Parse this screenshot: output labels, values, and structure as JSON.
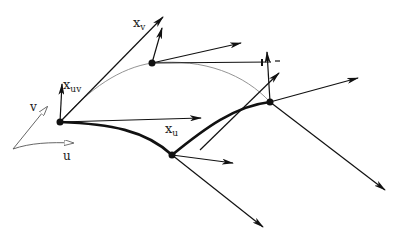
{
  "diagram": {
    "labels": {
      "xv": {
        "base": "x",
        "sub": "v"
      },
      "xuv": {
        "base": "x",
        "sub": "uv"
      },
      "xu": {
        "base": "x",
        "sub": "u"
      },
      "u": "u",
      "v": "v"
    },
    "points": {
      "A": [
        60,
        122
      ],
      "B": [
        152,
        63
      ],
      "C": [
        172,
        155
      ],
      "D": [
        270,
        102
      ]
    },
    "colors": {
      "ink": "#111111",
      "thin_curve": "#888888"
    }
  }
}
